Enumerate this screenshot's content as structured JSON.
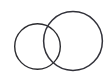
{
  "figure": {
    "background_color": "#ffffff",
    "width": 112,
    "height": 77
  },
  "diagram_data": {
    "type": "geometric-line-drawing",
    "shape_count": 2,
    "stroke_color": "#2b2b2f",
    "fill": "none",
    "shapes": [
      {
        "name": "left-circle",
        "type": "circle",
        "cx": 37.5,
        "cy": 46.5,
        "r": 22.8,
        "stroke_color": "#2b2b2f",
        "stroke_width": 1.4,
        "fill": "none"
      },
      {
        "name": "right-circle",
        "type": "circle",
        "cx": 73.0,
        "cy": 41.0,
        "r": 29.4,
        "stroke_color": "#32323a",
        "stroke_width": 1.5,
        "fill": "none"
      }
    ],
    "intersection_points": [
      {
        "name": "upper-intersection",
        "x": 52,
        "y": 27
      },
      {
        "name": "lower-intersection",
        "x": 54,
        "y": 62
      }
    ],
    "extents": {
      "left_circle": {
        "left": 14.7,
        "right": 60.3,
        "top": 23.7,
        "bottom": 69.3
      },
      "right_circle": {
        "left": 43.6,
        "right": 102.4,
        "top": 11.6,
        "bottom": 70.4
      }
    }
  }
}
